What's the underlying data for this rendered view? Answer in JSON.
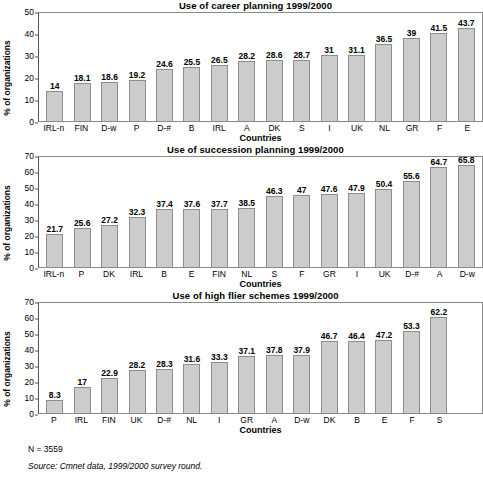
{
  "figure": {
    "ylabel": "% of organizations",
    "xlabel": "Countries"
  },
  "footer": {
    "n_text": "N = 3559",
    "source_text": "Source: Cmnet data, 1999/2000 survey round."
  },
  "chart_data": [
    {
      "type": "bar",
      "title": "Use of career planning 1999/2000",
      "xlabel": "Countries",
      "ylabel": "% of organizations",
      "ylim": [
        0,
        50
      ],
      "yticks": [
        0,
        10,
        20,
        30,
        40,
        50
      ],
      "grid": false,
      "legend": "none",
      "categories": [
        "IRL-n",
        "FIN",
        "D-w",
        "P",
        "D-#",
        "B",
        "IRL",
        "A",
        "DK",
        "S",
        "I",
        "UK",
        "NL",
        "GR",
        "F",
        "E"
      ],
      "values": [
        14,
        18.1,
        18.6,
        19.2,
        24.6,
        25.5,
        26.5,
        28.2,
        28.6,
        28.7,
        31,
        31.1,
        36.5,
        39,
        41.5,
        43.7
      ],
      "value_labels": [
        "14",
        "18.1",
        "18.6",
        "19.2",
        "24.6",
        "25.5",
        "26.5",
        "28.2",
        "28.6",
        "28.7",
        "31",
        "31.1",
        "36.5",
        "39",
        "41.5",
        "43.7"
      ]
    },
    {
      "type": "bar",
      "title": "Use of succession planning 1999/2000",
      "xlabel": "Countries",
      "ylabel": "% of organizations",
      "ylim": [
        0,
        70
      ],
      "yticks": [
        0,
        10,
        20,
        30,
        40,
        50,
        60,
        70
      ],
      "grid": false,
      "legend": "none",
      "categories": [
        "IRL-n",
        "P",
        "DK",
        "IRL",
        "B",
        "E",
        "FIN",
        "NL",
        "S",
        "F",
        "GR",
        "I",
        "UK",
        "D-#",
        "A",
        "D-w"
      ],
      "values": [
        21.7,
        25.6,
        27.2,
        32.3,
        37.4,
        37.6,
        37.7,
        38.5,
        46.3,
        47,
        47.6,
        47.9,
        50.4,
        55.6,
        64.7,
        65.8
      ],
      "value_labels": [
        "21.7",
        "25.6",
        "27.2",
        "32.3",
        "37.4",
        "37.6",
        "37.7",
        "38.5",
        "46.3",
        "47",
        "47.6",
        "47.9",
        "50.4",
        "55.6",
        "64.7",
        "65.8"
      ]
    },
    {
      "type": "bar",
      "title": "Use of high flier schemes 1999/2000",
      "xlabel": "Countries",
      "ylabel": "% of organizations",
      "ylim": [
        0,
        70
      ],
      "yticks": [
        0,
        10,
        20,
        30,
        40,
        50,
        60,
        70
      ],
      "grid": false,
      "legend": "none",
      "categories": [
        "P",
        "IRL",
        "FIN",
        "UK",
        "D-#",
        "NL",
        "I",
        "GR",
        "A",
        "D-w",
        "DK",
        "B",
        "E",
        "F",
        "S"
      ],
      "values": [
        8.3,
        17,
        22.9,
        28.2,
        28.3,
        31.6,
        33.3,
        37.1,
        37.8,
        37.9,
        46.7,
        46.4,
        47.2,
        53.3,
        62.2
      ],
      "value_labels": [
        "8.3",
        "17",
        "22.9",
        "28.2",
        "28.3",
        "31.6",
        "33.3",
        "37.1",
        "37.8",
        "37.9",
        "46.7",
        "46.4",
        "47.2",
        "53.3",
        "62.2"
      ]
    }
  ],
  "colors": {
    "bar_fill": "#cccccc",
    "bar_border": "#8d8d8d",
    "axis": "#555555",
    "frame": "#8a8a8a"
  }
}
